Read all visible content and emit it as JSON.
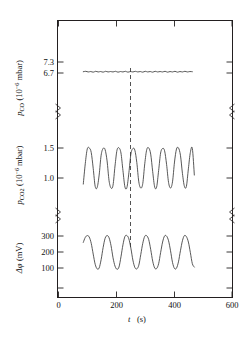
{
  "figure": {
    "background": "#ffffff",
    "trace_color": "#3a3a3a",
    "axis_color": "#231f20",
    "marker_color": "#4a4a4a"
  },
  "axes": {
    "x": {
      "label_symbol": "t",
      "label_unit": "(s)",
      "ticks": [
        "0",
        "200",
        "400",
        "600"
      ],
      "tick_values": [
        0,
        200,
        400,
        600
      ],
      "min": 0,
      "max": 700
    },
    "panel_co": {
      "label_symbol": "p",
      "label_sub": "CO",
      "label_unit_pre": "(10",
      "label_unit_sup": "−6",
      "label_unit_post": " mbar)",
      "ticks": [
        "7.3",
        "6.7"
      ],
      "tick_values": [
        7.3,
        6.7
      ]
    },
    "panel_co2": {
      "label_symbol": "p",
      "label_sub": "CO",
      "label_sub2": "2",
      "label_unit_pre": "(10",
      "label_unit_sup": "−6",
      "label_unit_post": " mbar)",
      "ticks": [
        "1.5",
        "1.0"
      ],
      "tick_values": [
        1.5,
        1.0
      ]
    },
    "panel_dphi": {
      "label_symbol": "Δφ",
      "label_unit": "(mV)",
      "ticks": [
        "300",
        "200",
        "100"
      ],
      "tick_values": [
        300,
        200,
        100
      ]
    }
  },
  "annotations": {
    "marker_line_t": 250,
    "marker_line_style": "dashed-vertical"
  },
  "chart_data": {
    "type": "line",
    "title": "",
    "xlabel": "t (s)",
    "xlim": [
      0,
      700
    ],
    "grid": false,
    "legend": "none",
    "panels": [
      {
        "name": "p_CO",
        "ylabel": "p_CO (10^-6 mbar)",
        "ylim": [
          6.4,
          7.55
        ],
        "yticks": [
          7.3,
          6.7
        ],
        "description": "near-flat trace with small ripples around 6.78, ~7 shallow periods",
        "x": [
          100,
          110,
          120,
          130,
          140,
          150,
          160,
          170,
          180,
          190,
          200,
          210,
          220,
          230,
          240,
          250,
          260,
          270,
          280,
          290,
          300,
          310,
          320,
          330,
          340,
          350,
          360,
          370,
          380,
          390,
          400,
          410,
          420,
          430,
          440,
          450,
          460,
          470,
          480,
          490,
          500,
          510,
          520,
          530,
          540
        ],
        "y": [
          6.78,
          6.8,
          6.77,
          6.79,
          6.76,
          6.8,
          6.77,
          6.79,
          6.76,
          6.8,
          6.77,
          6.79,
          6.77,
          6.8,
          6.76,
          6.79,
          6.77,
          6.8,
          6.76,
          6.79,
          6.77,
          6.8,
          6.77,
          6.79,
          6.76,
          6.8,
          6.77,
          6.79,
          6.76,
          6.8,
          6.77,
          6.79,
          6.77,
          6.8,
          6.76,
          6.79,
          6.77,
          6.8,
          6.76,
          6.79,
          6.77,
          6.8,
          6.77,
          6.79,
          6.78
        ]
      },
      {
        "name": "p_CO2",
        "ylabel": "p_CO2 (10^-6 mbar)",
        "ylim": [
          0.8,
          1.72
        ],
        "yticks": [
          1.5,
          1.0
        ],
        "description": "7 relaxation-type oscillations, broad rounded maxima ~1.57, sharp minima ~0.88",
        "period_s": 63,
        "max": 1.58,
        "min": 0.87,
        "x": [
          100,
          108,
          116,
          124,
          132,
          140,
          148,
          156,
          164,
          172,
          180,
          188,
          196,
          204,
          212,
          220,
          228,
          236,
          244,
          252,
          260,
          268,
          276,
          284,
          292,
          300,
          308,
          316,
          324,
          332,
          340,
          348,
          356,
          364,
          372,
          380,
          388,
          396,
          404,
          412,
          420,
          428,
          436,
          444,
          452,
          460,
          468,
          476,
          484,
          492,
          500,
          508,
          516,
          524,
          532,
          540,
          548
        ],
        "y": [
          0.94,
          1.3,
          1.56,
          1.58,
          1.5,
          1.22,
          0.9,
          0.88,
          1.1,
          1.45,
          1.57,
          1.55,
          1.35,
          1.0,
          0.87,
          0.92,
          1.26,
          1.54,
          1.58,
          1.49,
          1.18,
          0.89,
          0.88,
          1.14,
          1.47,
          1.57,
          1.54,
          1.32,
          0.98,
          0.87,
          0.95,
          1.3,
          1.55,
          1.58,
          1.47,
          1.16,
          0.89,
          0.89,
          1.18,
          1.49,
          1.57,
          1.53,
          1.29,
          0.97,
          0.87,
          0.98,
          1.33,
          1.56,
          1.58,
          1.45,
          1.13,
          0.9,
          0.9,
          1.21,
          1.5,
          1.57,
          1.1
        ]
      },
      {
        "name": "delta_phi",
        "ylabel": "Δφ (mV)",
        "ylim": [
          60,
          330
        ],
        "yticks": [
          300,
          200,
          100
        ],
        "description": "7 quasi-sinusoidal oscillations between ~118 and ~300 mV",
        "period_s": 63,
        "max": 300,
        "min": 118,
        "x": [
          100,
          108,
          116,
          124,
          132,
          140,
          148,
          156,
          164,
          172,
          180,
          188,
          196,
          204,
          212,
          220,
          228,
          236,
          244,
          252,
          260,
          268,
          276,
          284,
          292,
          300,
          308,
          316,
          324,
          332,
          340,
          348,
          356,
          364,
          372,
          380,
          388,
          396,
          404,
          412,
          420,
          428,
          436,
          444,
          452,
          460,
          468,
          476,
          484,
          492,
          500,
          508,
          516,
          524,
          532,
          540,
          548
        ],
        "y": [
          263,
          290,
          300,
          292,
          258,
          200,
          145,
          120,
          125,
          170,
          235,
          285,
          300,
          288,
          245,
          180,
          135,
          118,
          130,
          185,
          250,
          295,
          300,
          282,
          232,
          168,
          128,
          120,
          140,
          198,
          258,
          296,
          299,
          278,
          225,
          162,
          125,
          122,
          148,
          208,
          265,
          298,
          297,
          272,
          218,
          155,
          122,
          124,
          158,
          218,
          272,
          300,
          294,
          265,
          208,
          148,
          130
        ]
      }
    ]
  }
}
